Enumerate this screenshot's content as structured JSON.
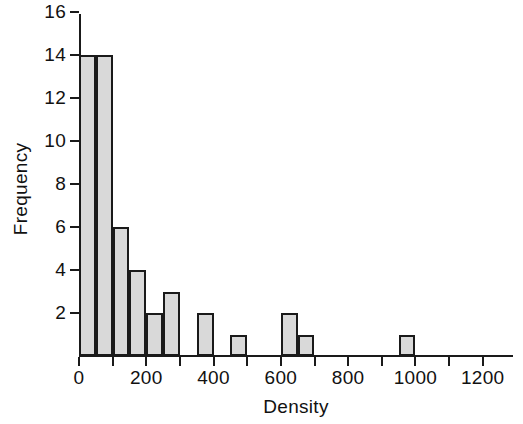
{
  "chart_data": {
    "type": "bar",
    "subtype": "histogram",
    "title": "",
    "xlabel": "Density",
    "ylabel": "Frequency",
    "xlim": [
      0,
      1290
    ],
    "ylim": [
      0,
      16.3
    ],
    "grid": false,
    "legend": null,
    "bin_width": 50,
    "x_ticks": [
      0,
      100,
      200,
      300,
      400,
      500,
      600,
      700,
      800,
      900,
      1000,
      1100,
      1200
    ],
    "x_tick_labels": [
      "0",
      "",
      "200",
      "",
      "400",
      "",
      "600",
      "",
      "800",
      "",
      "1000",
      "",
      "1200"
    ],
    "y_ticks": [
      2,
      4,
      6,
      8,
      10,
      12,
      14,
      16
    ],
    "y_tick_labels": [
      "2",
      "4",
      "6",
      "8",
      "10",
      "12",
      "14",
      "16"
    ],
    "bins": [
      {
        "x0": 0,
        "x1": 50,
        "value": 14
      },
      {
        "x0": 50,
        "x1": 100,
        "value": 14
      },
      {
        "x0": 100,
        "x1": 150,
        "value": 6
      },
      {
        "x0": 150,
        "x1": 200,
        "value": 4
      },
      {
        "x0": 200,
        "x1": 250,
        "value": 2
      },
      {
        "x0": 250,
        "x1": 300,
        "value": 3
      },
      {
        "x0": 300,
        "x1": 350,
        "value": 0
      },
      {
        "x0": 350,
        "x1": 400,
        "value": 2
      },
      {
        "x0": 400,
        "x1": 450,
        "value": 0
      },
      {
        "x0": 450,
        "x1": 500,
        "value": 1
      },
      {
        "x0": 500,
        "x1": 550,
        "value": 0
      },
      {
        "x0": 550,
        "x1": 600,
        "value": 0
      },
      {
        "x0": 600,
        "x1": 650,
        "value": 2
      },
      {
        "x0": 650,
        "x1": 700,
        "value": 1
      },
      {
        "x0": 700,
        "x1": 750,
        "value": 0
      },
      {
        "x0": 750,
        "x1": 800,
        "value": 0
      },
      {
        "x0": 800,
        "x1": 850,
        "value": 0
      },
      {
        "x0": 850,
        "x1": 900,
        "value": 0
      },
      {
        "x0": 900,
        "x1": 950,
        "value": 0
      },
      {
        "x0": 950,
        "x1": 1000,
        "value": 1
      },
      {
        "x0": 1000,
        "x1": 1050,
        "value": 0
      },
      {
        "x0": 1050,
        "x1": 1100,
        "value": 0
      },
      {
        "x0": 1100,
        "x1": 1150,
        "value": 0
      },
      {
        "x0": 1150,
        "x1": 1200,
        "value": 0
      },
      {
        "x0": 1200,
        "x1": 1250,
        "value": 0
      }
    ],
    "colors": {
      "bar_fill": "#d9d9d9",
      "bar_edge": "#1a1a1a",
      "axis": "#1a1a1a",
      "text": "#111111",
      "background": "#ffffff"
    }
  }
}
